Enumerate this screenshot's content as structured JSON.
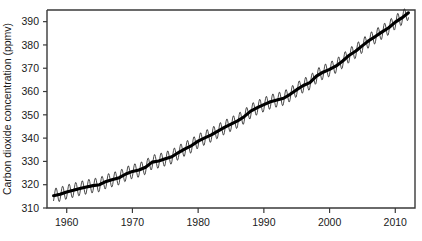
{
  "chart_data": {
    "type": "line",
    "title": "",
    "xlabel": "",
    "ylabel": "Carbon dioxide concentration (ppmv)",
    "xlim": [
      1957,
      2013
    ],
    "ylim": [
      310,
      395
    ],
    "grid": false,
    "legend": "none",
    "x_ticks": [
      1960,
      1970,
      1980,
      1990,
      2000,
      2010
    ],
    "x_tick_labels": [
      "1960",
      "1970",
      "1980",
      "1990",
      "2000",
      "2010"
    ],
    "y_ticks": [
      310,
      320,
      330,
      340,
      350,
      360,
      370,
      380,
      390
    ],
    "y_tick_labels": [
      "310",
      "320",
      "330",
      "340",
      "350",
      "360",
      "370",
      "380",
      "390"
    ],
    "annotations": [],
    "series": [
      {
        "name": "Monthly mean CO2",
        "style": "thin-line-seasonal-sawtooth",
        "color": "#2b2b2b",
        "seasonal_amplitude_ppmv": 3.1,
        "x": [
          1958,
          1959,
          1960,
          1961,
          1962,
          1963,
          1964,
          1965,
          1966,
          1967,
          1968,
          1969,
          1970,
          1971,
          1972,
          1973,
          1974,
          1975,
          1976,
          1977,
          1978,
          1979,
          1980,
          1981,
          1982,
          1983,
          1984,
          1985,
          1986,
          1987,
          1988,
          1989,
          1990,
          1991,
          1992,
          1993,
          1994,
          1995,
          1996,
          1997,
          1998,
          1999,
          2000,
          2001,
          2002,
          2003,
          2004,
          2005,
          2006,
          2007,
          2008,
          2009,
          2010,
          2011,
          2012
        ],
        "values": [
          315.3,
          315.9,
          316.9,
          317.6,
          318.4,
          319.0,
          319.6,
          320.0,
          321.4,
          322.2,
          323.0,
          324.6,
          325.7,
          326.3,
          327.5,
          329.7,
          330.2,
          331.1,
          332.0,
          333.8,
          335.4,
          336.8,
          338.7,
          340.1,
          341.4,
          343.0,
          344.6,
          346.0,
          347.4,
          349.2,
          351.6,
          353.1,
          354.4,
          355.6,
          356.4,
          357.1,
          358.8,
          360.8,
          362.6,
          363.8,
          366.6,
          368.3,
          369.5,
          371.0,
          373.1,
          375.6,
          377.4,
          379.7,
          381.9,
          383.7,
          385.6,
          387.4,
          389.8,
          391.6,
          393.8
        ]
      },
      {
        "name": "Smoothed trend",
        "style": "thick-line",
        "color": "#000000",
        "x": [
          1958,
          1959,
          1960,
          1961,
          1962,
          1963,
          1964,
          1965,
          1966,
          1967,
          1968,
          1969,
          1970,
          1971,
          1972,
          1973,
          1974,
          1975,
          1976,
          1977,
          1978,
          1979,
          1980,
          1981,
          1982,
          1983,
          1984,
          1985,
          1986,
          1987,
          1988,
          1989,
          1990,
          1991,
          1992,
          1993,
          1994,
          1995,
          1996,
          1997,
          1998,
          1999,
          2000,
          2001,
          2002,
          2003,
          2004,
          2005,
          2006,
          2007,
          2008,
          2009,
          2010,
          2011,
          2012
        ],
        "values": [
          315.3,
          315.9,
          316.9,
          317.6,
          318.4,
          319.0,
          319.6,
          320.0,
          321.4,
          322.2,
          323.0,
          324.6,
          325.7,
          326.3,
          327.5,
          329.7,
          330.2,
          331.1,
          332.0,
          333.8,
          335.4,
          336.8,
          338.7,
          340.1,
          341.4,
          343.0,
          344.6,
          346.0,
          347.4,
          349.2,
          351.6,
          353.1,
          354.4,
          355.6,
          356.4,
          357.1,
          358.8,
          360.8,
          362.6,
          363.8,
          366.6,
          368.3,
          369.5,
          371.0,
          373.1,
          375.6,
          377.4,
          379.7,
          381.9,
          383.7,
          385.6,
          387.4,
          389.8,
          391.6,
          393.8
        ]
      }
    ]
  }
}
